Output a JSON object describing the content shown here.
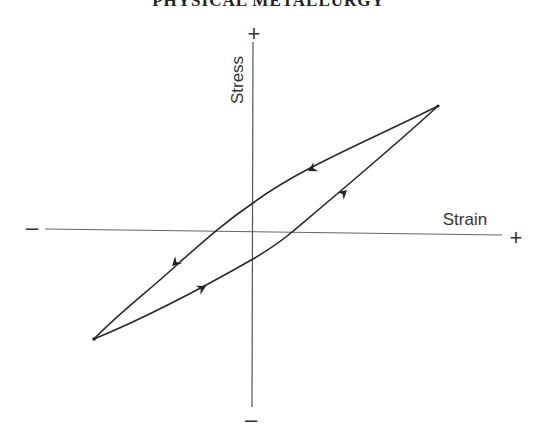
{
  "header": {
    "running_title": "PHYSICAL METALLURGY"
  },
  "diagram": {
    "type": "hysteresis-loop",
    "axes": {
      "x_label": "Strain",
      "y_label": "Stress",
      "x_positive": "+",
      "x_negative": "–",
      "y_positive": "+",
      "y_negative": "–"
    },
    "loop": {
      "upper_branch": "unloading (arrows pointing toward compression)",
      "lower_branch": "loading (arrows pointing toward tension)"
    },
    "colors": {
      "line": "#2a2a2a",
      "axis": "#555555",
      "text": "#333333"
    }
  }
}
